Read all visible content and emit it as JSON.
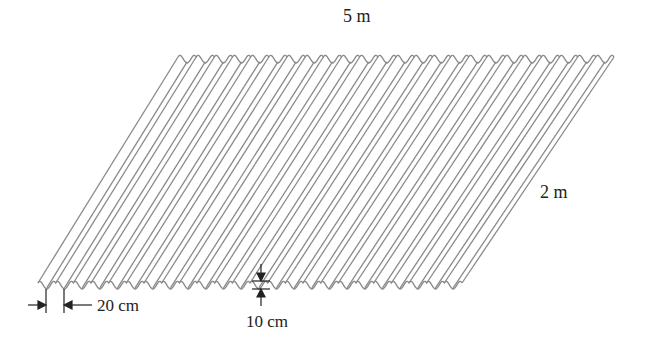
{
  "figure": {
    "type": "corrugated sheet diagram",
    "labels": {
      "length": "5 m",
      "slant_width": "2 m",
      "pitch": "20 cm",
      "depth": "10 cm"
    },
    "geometry": {
      "bottom_edge": {
        "x_start": 38,
        "x_end": 462,
        "y": 283
      },
      "top_edge": {
        "x_start": 178,
        "x_end": 614,
        "y": 57
      },
      "wave_count": 24,
      "wave_amplitude_px": 6
    },
    "colors": {
      "sheet_line": "#8a8a8a",
      "dimension_line": "#222222",
      "text": "#222222"
    }
  }
}
